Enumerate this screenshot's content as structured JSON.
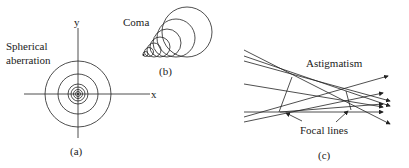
{
  "diagram": {
    "panels": [
      {
        "id": "a",
        "caption": "(a)",
        "label": [
          "Spherical",
          "aberration"
        ],
        "axes": {
          "x": "x",
          "y": "y"
        }
      },
      {
        "id": "b",
        "caption": "(b)",
        "label": "Coma"
      },
      {
        "id": "c",
        "caption": "(c)",
        "label": "Astigmatism",
        "annotation": "Focal lines"
      }
    ]
  }
}
